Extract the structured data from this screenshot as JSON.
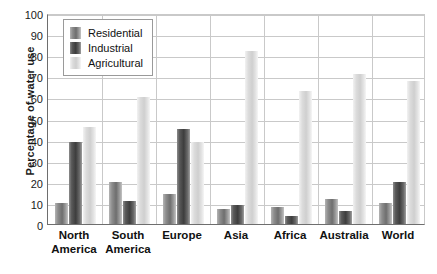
{
  "chart_data": {
    "type": "bar",
    "title": "",
    "subtitle": "",
    "xlabel": "",
    "ylabel": "Percentage of water use",
    "ylim": [
      0,
      100
    ],
    "ytick_step": 10,
    "yticks": [
      0,
      10,
      20,
      30,
      40,
      50,
      60,
      70,
      80,
      90,
      100
    ],
    "grid": true,
    "legend_position": "top-left-inside",
    "categories": [
      "North America",
      "South America",
      "Europe",
      "Asia",
      "Africa",
      "Australia",
      "World"
    ],
    "category_lines": [
      [
        "North",
        "America"
      ],
      [
        "South",
        "America"
      ],
      [
        "Europe",
        ""
      ],
      [
        "Asia",
        ""
      ],
      [
        "Africa",
        ""
      ],
      [
        "Australia",
        ""
      ],
      [
        "World",
        ""
      ]
    ],
    "series": [
      {
        "name": "Residential",
        "color": "#6e6e6e",
        "values": [
          10,
          20,
          14,
          7,
          8,
          12,
          10
        ]
      },
      {
        "name": "Industrial",
        "color": "#3d3d3d",
        "values": [
          39,
          11,
          45,
          9,
          4,
          6,
          20
        ]
      },
      {
        "name": "Agricultural",
        "color": "#cfcfcf",
        "values": [
          46,
          60,
          39,
          82,
          63,
          71,
          68
        ]
      }
    ]
  },
  "legend": {
    "items": [
      {
        "label": "Residential",
        "swatch": "residential-swatch"
      },
      {
        "label": "Industrial",
        "swatch": "industrial-swatch"
      },
      {
        "label": "Agricultural",
        "swatch": "agricultural-swatch"
      }
    ]
  },
  "axis": {
    "y_title": "Percentage of water use"
  }
}
